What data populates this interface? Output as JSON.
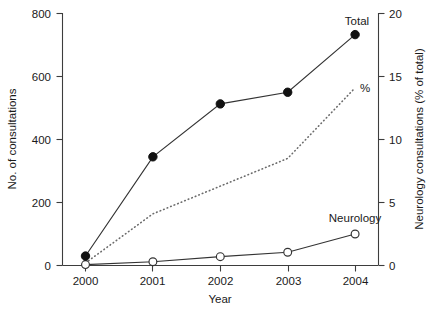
{
  "chart_data": {
    "type": "line",
    "title": "",
    "xlabel": "Year",
    "ylabel": "No. of consultations",
    "y2label": "Neurology consultations (% of total)",
    "categories": [
      "2000",
      "2001",
      "2002",
      "2003",
      "2004"
    ],
    "x": [
      2000,
      2001,
      2002,
      2003,
      2004
    ],
    "ylim": [
      0,
      800
    ],
    "yticks": [
      0,
      200,
      400,
      600,
      800
    ],
    "y2lim": [
      0,
      20
    ],
    "y2ticks": [
      0,
      5,
      10,
      15,
      20
    ],
    "grid": false,
    "legend_position": "inline-annotations",
    "series": [
      {
        "name": "Total",
        "axis": "left",
        "marker": "filled-circle",
        "line": "solid",
        "values": [
          30,
          345,
          513,
          550,
          733
        ],
        "label": "Total"
      },
      {
        "name": "Neurology",
        "axis": "left",
        "marker": "open-circle",
        "line": "solid",
        "values": [
          3,
          12,
          28,
          42,
          100
        ],
        "label": "Neurology"
      },
      {
        "name": "%",
        "axis": "right",
        "marker": "none",
        "line": "dotted",
        "values": [
          0.2,
          4.1,
          6.3,
          8.5,
          14.1
        ],
        "label": "%"
      }
    ]
  },
  "axes": {
    "left": {
      "title": "No. of consultations",
      "ticks": [
        "0",
        "200",
        "400",
        "600",
        "800"
      ]
    },
    "right": {
      "title": "Neurology consultations (% of total)",
      "ticks": [
        "0",
        "5",
        "10",
        "15",
        "20"
      ]
    },
    "bottom": {
      "title": "Year",
      "ticks": [
        "2000",
        "2001",
        "2002",
        "2003",
        "2004"
      ]
    }
  },
  "annotations": {
    "total": "Total",
    "neurology": "Neurology",
    "percent": "%"
  },
  "colors": {
    "axis": "#3d3d3d",
    "solid_line": "#333333",
    "dotted_line": "#6b6b6b",
    "filled_marker": "#111111",
    "open_marker_fill": "#ffffff",
    "text": "#1a1a1a",
    "background": "#ffffff"
  }
}
